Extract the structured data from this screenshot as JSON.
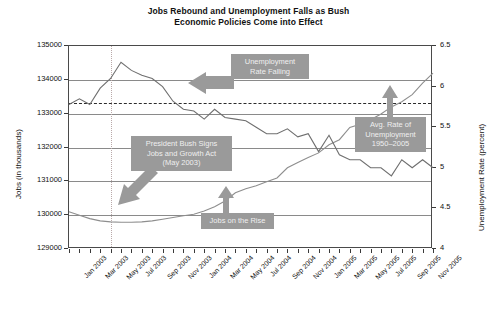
{
  "chart_data": {
    "type": "line",
    "title": "Jobs Rebound and Unemployment Falls as Bush Economic Policies Come into Effect",
    "title_line1": "Jobs Rebound and Unemployment Falls as Bush",
    "title_line2": "Economic Policies Come into Effect",
    "xlabel": "",
    "ylabel": "Jobs (in thousands)",
    "y2label": "Unemployment Rate (percent)",
    "ylim": [
      129000,
      135000
    ],
    "y2lim": [
      4,
      6.5
    ],
    "yticks": [
      129000,
      130000,
      131000,
      132000,
      133000,
      134000,
      135000
    ],
    "y2ticks": [
      "4",
      "4.5",
      "5",
      "5.5",
      "6",
      "6.5"
    ],
    "grid": true,
    "legend": "none",
    "x": [
      "Jan 2003",
      "Feb 2003",
      "Mar 2003",
      "Apr 2003",
      "May 2003",
      "Jun 2003",
      "Jul 2003",
      "Aug 2003",
      "Sep 2003",
      "Oct 2003",
      "Nov 2003",
      "Dec 2003",
      "Jan 2004",
      "Feb 2004",
      "Mar 2004",
      "Apr 2004",
      "May 2004",
      "Jun 2004",
      "Jul 2004",
      "Aug 2004",
      "Sep 2004",
      "Oct 2004",
      "Nov 2004",
      "Dec 2004",
      "Jan 2005",
      "Feb 2005",
      "Mar 2005",
      "Apr 2005",
      "May 2005",
      "Jun 2005",
      "Jul 2005",
      "Aug 2005",
      "Sep 2005",
      "Oct 2005",
      "Nov 2005",
      "Dec 2005"
    ],
    "xtick_labels": [
      "Jan 2003",
      "Mar 2003",
      "May 2003",
      "Jul 2003",
      "Sep 2003",
      "Nov 2003",
      "Jan 2004",
      "Mar 2004",
      "May 2004",
      "Jul 2004",
      "Sep 2004",
      "Nov 2004",
      "Jan 2005",
      "Mar 2005",
      "May 2005",
      "Jul 2005",
      "Sep 2005",
      "Nov 2005"
    ],
    "series": [
      {
        "name": "Jobs (in thousands)",
        "axis": "left",
        "values": [
          130100,
          130000,
          129900,
          129830,
          129800,
          129790,
          129790,
          129800,
          129830,
          129880,
          129930,
          129980,
          130030,
          130120,
          130250,
          130420,
          130660,
          130780,
          130870,
          130990,
          131100,
          131400,
          131560,
          131700,
          131840,
          132080,
          132230,
          132590,
          132690,
          132820,
          132990,
          133200,
          133350,
          133560,
          133900,
          134200
        ]
      },
      {
        "name": "Unemployment Rate (percent)",
        "axis": "right",
        "values": [
          5.78,
          5.85,
          5.78,
          5.98,
          6.1,
          6.3,
          6.2,
          6.14,
          6.1,
          6.0,
          5.82,
          5.72,
          5.7,
          5.6,
          5.72,
          5.62,
          5.6,
          5.58,
          5.5,
          5.42,
          5.42,
          5.48,
          5.38,
          5.42,
          5.2,
          5.4,
          5.16,
          5.1,
          5.1,
          5.0,
          5.0,
          4.9,
          5.1,
          5.0,
          5.1,
          5.0
        ]
      }
    ],
    "reference_lines": [
      {
        "name": "avg-unemployment-1950-2005",
        "axis": "right",
        "value": 5.8,
        "style": "dashed"
      },
      {
        "name": "jobs-and-growth-act-date",
        "axis": "x",
        "value": "May 2003",
        "style": "dotted"
      }
    ],
    "annotations": [
      {
        "name": "unemployment-rate-falling",
        "lines": [
          "Unemployment",
          "Rate Falling"
        ],
        "arrow": "left"
      },
      {
        "name": "president-bush-signs-jobs-and-growth-act",
        "lines": [
          "President Bush Signs",
          "Jobs and Growth Act",
          "(May 2003)"
        ],
        "arrow": "down-left"
      },
      {
        "name": "avg-rate-of-unemployment",
        "lines": [
          "Avg. Rate of",
          "Unemployment",
          "1950–2005"
        ],
        "arrow": "up"
      },
      {
        "name": "jobs-on-the-rise",
        "lines": [
          "Jobs on the Rise"
        ],
        "arrow": "up"
      }
    ]
  }
}
